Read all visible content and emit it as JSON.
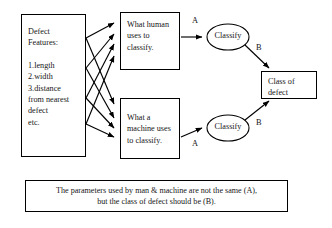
{
  "diagram": {
    "nodes": {
      "features": {
        "title": "Defect\nFeatures:",
        "list": "1.length\n2.width\n3.distance\n  from nearest\n  defect\netc."
      },
      "human": {
        "text": "What human\nuses to\nclassify."
      },
      "machine": {
        "text": "What a\nmachine uses\nto classify."
      },
      "classify_top": {
        "label": "Classify"
      },
      "classify_bottom": {
        "label": "Classify"
      },
      "class_of_defect": {
        "text": "Class of\ndefect"
      }
    },
    "edge_labels": {
      "a_top": "A",
      "b_top": "B",
      "a_bottom": "A",
      "b_bottom": "B"
    },
    "caption": "The parameters used by man & machine are not the same (A),\nbut the class of defect should be (B).",
    "colors": {
      "stroke": "#000000",
      "background": "#ffffff",
      "text": "#161616"
    }
  }
}
